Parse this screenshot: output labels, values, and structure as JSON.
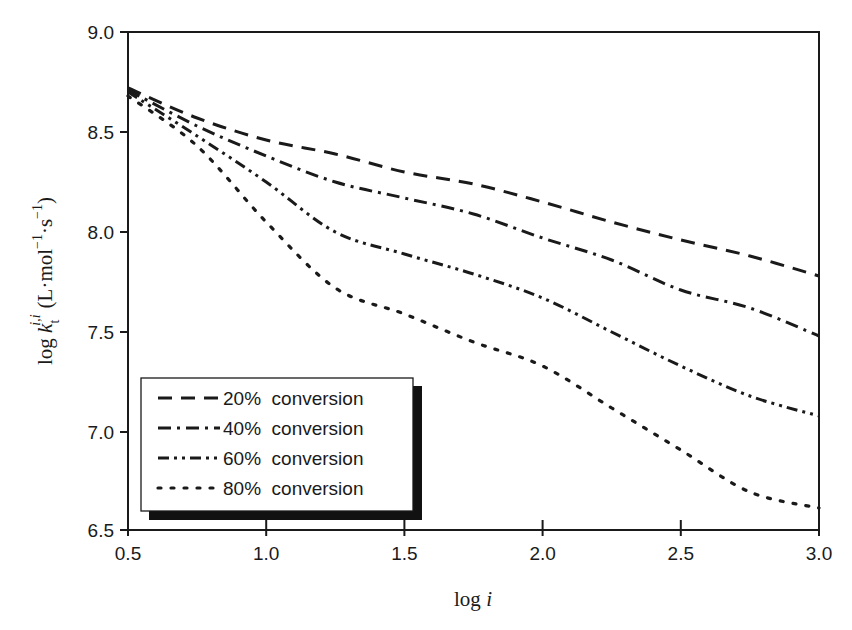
{
  "chart_data": {
    "type": "line",
    "title": "",
    "xlabel": "log i",
    "ylabel": "log k_t^{i,i} (L·mol^-1·s^-1)",
    "ylabel_parts": {
      "prefix": "log ",
      "k": "k",
      "sub": "t",
      "sup": "i,i",
      "units_open": "(L·mol",
      "units_exp1": "−1",
      "units_mid": "·s",
      "units_exp2": "−1",
      "units_close": ")"
    },
    "xlim": [
      0.5,
      3.0
    ],
    "ylim": [
      6.5,
      9.0
    ],
    "xticks": [
      0.5,
      1.0,
      1.5,
      2.0,
      2.5,
      3.0
    ],
    "xtick_labels": [
      "0.5",
      "1.0",
      "1.5",
      "2.0",
      "2.5",
      "3.0"
    ],
    "yticks": [
      6.5,
      7.0,
      7.5,
      8.0,
      8.5,
      9.0
    ],
    "ytick_labels": [
      "6.5",
      "7.0",
      "7.5",
      "8.0",
      "8.5",
      "9.0"
    ],
    "grid": false,
    "legend_position": "lower left",
    "x": [
      0.5,
      0.75,
      1.0,
      1.25,
      1.5,
      1.75,
      2.0,
      2.25,
      2.5,
      2.75,
      3.0
    ],
    "series": [
      {
        "name": "20% conversion",
        "style": "dashed",
        "values": [
          8.72,
          8.57,
          8.46,
          8.39,
          8.3,
          8.24,
          8.15,
          8.05,
          7.96,
          7.88,
          7.78
        ]
      },
      {
        "name": "40% conversion",
        "style": "dash-dot",
        "values": [
          8.71,
          8.53,
          8.38,
          8.25,
          8.17,
          8.09,
          7.97,
          7.86,
          7.71,
          7.62,
          7.48
        ]
      },
      {
        "name": "60% conversion",
        "style": "dash-dot-dot",
        "values": [
          8.7,
          8.48,
          8.25,
          8.0,
          7.89,
          7.79,
          7.67,
          7.5,
          7.33,
          7.18,
          7.08
        ]
      },
      {
        "name": "80% conversion",
        "style": "dotted",
        "values": [
          8.68,
          8.43,
          8.05,
          7.72,
          7.59,
          7.45,
          7.33,
          7.12,
          6.91,
          6.7,
          6.62
        ]
      }
    ]
  },
  "legend": {
    "items": [
      {
        "label": "20% conversion"
      },
      {
        "label": "40% conversion"
      },
      {
        "label": "60% conversion"
      },
      {
        "label": "80% conversion"
      }
    ]
  },
  "colors": {
    "line": "#1a1a1a",
    "axis": "#1a1a1a",
    "background": "#ffffff",
    "legend_shadow": "#111111"
  }
}
